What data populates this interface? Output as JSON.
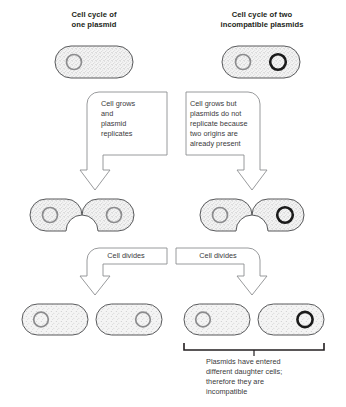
{
  "figure": {
    "title_left": "Cell cycle of\none plasmid",
    "title_right": "Cell cycle of two\nincompatible plasmids",
    "bottom_caption": "Plasmids have entered\ndifferent daughter cells;\ntherefore they are\nincompatible"
  },
  "steps": {
    "left_growth": "Cell grows\nand\nplasmid\nreplicates",
    "right_growth": "Cell grows but\nplasmids do not\nreplicate because\ntwo origins are\nalready present",
    "left_division": "Cell divides",
    "right_division": "Cell divides"
  },
  "colors": {
    "outline": "#58595b",
    "cytoplasm": "#f2f2f2",
    "stipple": "#6d6e71",
    "plasmid_gray": "#8c8c8e",
    "plasmid_black": "#1a1a1a",
    "text": "#231f20",
    "box_outline": "#8d8f91",
    "arrow_outline": "#8d8f91",
    "bracket": "#231f20"
  },
  "cells": {
    "row_top": [
      {
        "id": "top-left-cell",
        "plasmids": [
          "gray"
        ],
        "state": "single"
      },
      {
        "id": "top-right-cell",
        "plasmids": [
          "gray",
          "black"
        ],
        "state": "single"
      }
    ],
    "row_middle": [
      {
        "id": "middle-left-cell",
        "plasmids": [
          "gray",
          "gray"
        ],
        "state": "dividing"
      },
      {
        "id": "middle-right-cell",
        "plasmids": [
          "gray",
          "black"
        ],
        "state": "dividing"
      }
    ],
    "row_bottom": [
      {
        "id": "bottom-cell-1",
        "plasmids": [
          "gray"
        ],
        "state": "daughter"
      },
      {
        "id": "bottom-cell-2",
        "plasmids": [
          "gray"
        ],
        "state": "daughter"
      },
      {
        "id": "bottom-cell-3",
        "plasmids": [
          "gray"
        ],
        "state": "daughter"
      },
      {
        "id": "bottom-cell-4",
        "plasmids": [
          "black"
        ],
        "state": "daughter"
      }
    ]
  }
}
